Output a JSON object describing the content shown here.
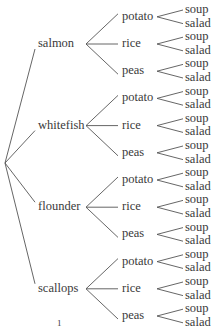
{
  "diagram": {
    "type": "tree",
    "levels": [
      "fish",
      "side",
      "starter"
    ],
    "fish": [
      "salmon",
      "whitefish",
      "flounder",
      "scallops"
    ],
    "sides": [
      "potato",
      "rice",
      "peas"
    ],
    "starters": [
      "soup",
      "salad"
    ],
    "footer_mark": "1",
    "line_color": "#555555"
  }
}
